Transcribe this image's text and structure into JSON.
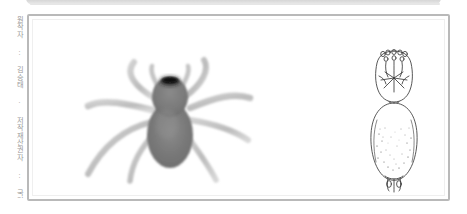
{
  "figure": {
    "credit_text": "원작자 : 김승태 · 저작재산권자 : 국립생물자원관",
    "sex_symbol": "♀",
    "panel_border_color": "#b9b9b9",
    "panel_background": "#ffffff",
    "band_color": "#cfcfcf",
    "credit_color": "#9a9a9a"
  },
  "photo": {
    "alt_name": "spider-dorsal-photograph",
    "body_color": "#7b7b7b",
    "leg_color": "#c2c2c2",
    "eye_color": "#1a1a1a"
  },
  "drawing": {
    "alt_name": "spider-body-line-drawing",
    "line_color": "#3a3a3a",
    "fill_color": "#ffffff"
  }
}
